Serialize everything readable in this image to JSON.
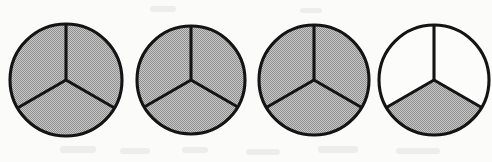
{
  "figure": {
    "kind": "fraction-circle-diagram",
    "background_color": "#fbfbfa",
    "outline_color": "#141414",
    "shade_color": "#a8a8a8",
    "unshaded_color": "#fcfcfb",
    "sectors_per_circle": 3,
    "total_circles": 4,
    "total_shaded_sectors": 10,
    "fraction_label": "10/3",
    "mixed_number_label": "3 1/3",
    "circles": [
      {
        "index": 1,
        "name": "circle-1",
        "cx": 66,
        "cy": 80,
        "r": 56,
        "shaded_sectors": [
          1,
          2,
          3
        ],
        "shaded_count": 3,
        "fraction": "3/3",
        "clipped": false
      },
      {
        "index": 2,
        "name": "circle-2",
        "cx": 191,
        "cy": 80,
        "r": 54,
        "shaded_sectors": [
          1,
          2,
          3
        ],
        "shaded_count": 3,
        "fraction": "3/3",
        "clipped": false
      },
      {
        "index": 3,
        "name": "circle-3",
        "cx": 314,
        "cy": 80,
        "r": 55,
        "shaded_sectors": [
          1,
          2,
          3
        ],
        "shaded_count": 3,
        "fraction": "3/3",
        "clipped": false
      },
      {
        "index": 4,
        "name": "circle-4",
        "cx": 434,
        "cy": 80,
        "r": 55,
        "shaded_sectors": [
          3
        ],
        "shaded_count": 1,
        "fraction": "1/3",
        "clipped": true
      }
    ],
    "sector_angles": {
      "sector_1_name": "upper-right",
      "sector_1_start_deg": -90,
      "sector_1_end_deg": 30,
      "sector_2_name": "lower-left",
      "sector_2_start_deg": 150,
      "sector_2_end_deg": 270,
      "sector_3_name": "bottom",
      "sector_3_start_deg": 30,
      "sector_3_end_deg": 150
    }
  }
}
